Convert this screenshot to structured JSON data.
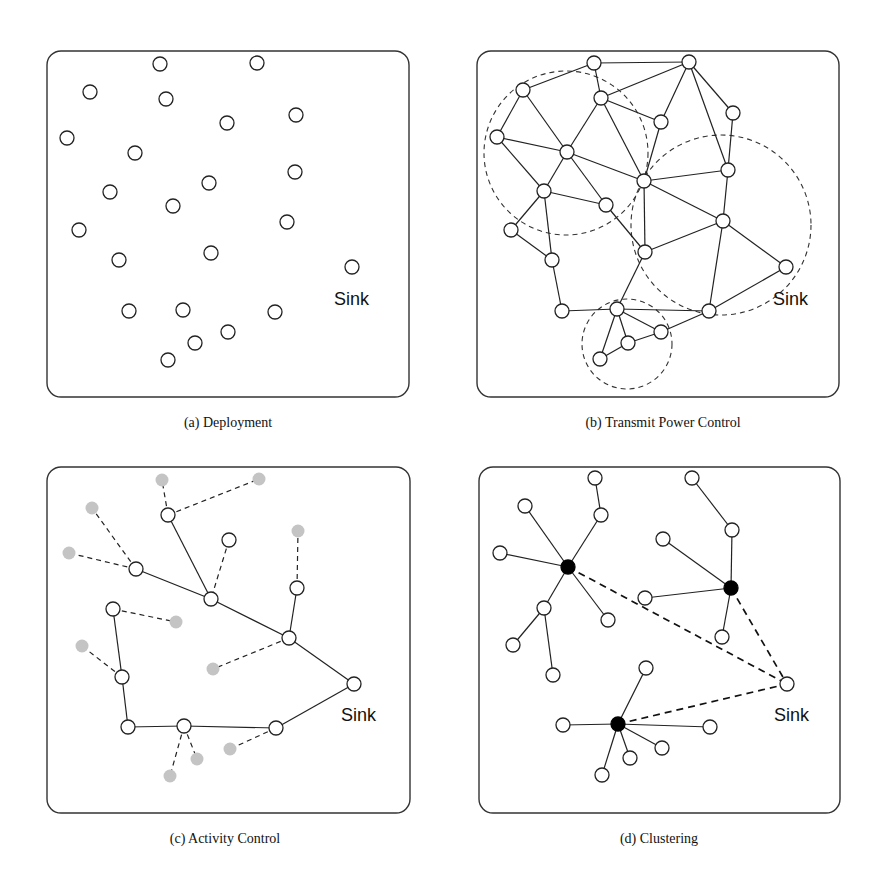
{
  "figure": {
    "panels": [
      {
        "id": "a",
        "caption": "(a)  Deployment",
        "box": {
          "x": 47,
          "y": 51,
          "w": 362,
          "h": 346
        },
        "caption_pos": {
          "x": 228,
          "y": 427
        },
        "sink_label": "Sink",
        "sink_label_pos": {
          "x": 334,
          "y": 305
        },
        "range_circles": [],
        "nodes": [
          {
            "x": 160,
            "y": 64,
            "type": "normal"
          },
          {
            "x": 257,
            "y": 63,
            "type": "normal"
          },
          {
            "x": 90,
            "y": 92,
            "type": "normal"
          },
          {
            "x": 166,
            "y": 99,
            "type": "normal"
          },
          {
            "x": 227,
            "y": 123,
            "type": "normal"
          },
          {
            "x": 296,
            "y": 115,
            "type": "normal"
          },
          {
            "x": 67,
            "y": 138,
            "type": "normal"
          },
          {
            "x": 135,
            "y": 153,
            "type": "normal"
          },
          {
            "x": 295,
            "y": 172,
            "type": "normal"
          },
          {
            "x": 110,
            "y": 192,
            "type": "normal"
          },
          {
            "x": 209,
            "y": 183,
            "type": "normal"
          },
          {
            "x": 173,
            "y": 206,
            "type": "normal"
          },
          {
            "x": 287,
            "y": 222,
            "type": "normal"
          },
          {
            "x": 79,
            "y": 230,
            "type": "normal"
          },
          {
            "x": 211,
            "y": 253,
            "type": "normal"
          },
          {
            "x": 119,
            "y": 260,
            "type": "normal"
          },
          {
            "x": 352,
            "y": 267,
            "type": "sink"
          },
          {
            "x": 129,
            "y": 311,
            "type": "normal"
          },
          {
            "x": 183,
            "y": 310,
            "type": "normal"
          },
          {
            "x": 275,
            "y": 312,
            "type": "normal"
          },
          {
            "x": 228,
            "y": 332,
            "type": "normal"
          },
          {
            "x": 195,
            "y": 343,
            "type": "normal"
          },
          {
            "x": 168,
            "y": 360,
            "type": "normal"
          }
        ],
        "edges": []
      },
      {
        "id": "b",
        "caption": "(b)  Transmit Power Control",
        "box": {
          "x": 477,
          "y": 51,
          "w": 362,
          "h": 346
        },
        "caption_pos": {
          "x": 663,
          "y": 427
        },
        "sink_label": "Sink",
        "sink_label_pos": {
          "x": 773,
          "y": 305
        },
        "range_circles": [
          {
            "cx": 566,
            "cy": 153,
            "r": 82
          },
          {
            "cx": 721,
            "cy": 225,
            "r": 90
          },
          {
            "cx": 627,
            "cy": 344,
            "r": 45
          }
        ],
        "nodes": [
          {
            "x": 594,
            "y": 63,
            "type": "normal"
          },
          {
            "x": 689,
            "y": 62,
            "type": "normal"
          },
          {
            "x": 523,
            "y": 90,
            "type": "normal"
          },
          {
            "x": 601,
            "y": 98,
            "type": "normal"
          },
          {
            "x": 661,
            "y": 122,
            "type": "normal"
          },
          {
            "x": 733,
            "y": 113,
            "type": "normal"
          },
          {
            "x": 497,
            "y": 137,
            "type": "normal"
          },
          {
            "x": 567,
            "y": 152,
            "type": "normal"
          },
          {
            "x": 644,
            "y": 181,
            "type": "normal"
          },
          {
            "x": 728,
            "y": 170,
            "type": "normal"
          },
          {
            "x": 544,
            "y": 191,
            "type": "normal"
          },
          {
            "x": 606,
            "y": 205,
            "type": "normal"
          },
          {
            "x": 723,
            "y": 221,
            "type": "normal"
          },
          {
            "x": 511,
            "y": 230,
            "type": "normal"
          },
          {
            "x": 645,
            "y": 252,
            "type": "normal"
          },
          {
            "x": 552,
            "y": 260,
            "type": "normal"
          },
          {
            "x": 786,
            "y": 267,
            "type": "sink"
          },
          {
            "x": 562,
            "y": 311,
            "type": "normal"
          },
          {
            "x": 617,
            "y": 309,
            "type": "normal"
          },
          {
            "x": 709,
            "y": 311,
            "type": "normal"
          },
          {
            "x": 661,
            "y": 332,
            "type": "normal"
          },
          {
            "x": 628,
            "y": 343,
            "type": "normal"
          },
          {
            "x": 600,
            "y": 359,
            "type": "normal"
          }
        ],
        "edges": [
          {
            "a": 0,
            "b": 1,
            "style": "solid"
          },
          {
            "a": 0,
            "b": 2,
            "style": "solid"
          },
          {
            "a": 0,
            "b": 3,
            "style": "solid"
          },
          {
            "a": 1,
            "b": 3,
            "style": "solid"
          },
          {
            "a": 1,
            "b": 4,
            "style": "solid"
          },
          {
            "a": 1,
            "b": 5,
            "style": "solid"
          },
          {
            "a": 1,
            "b": 9,
            "style": "solid"
          },
          {
            "a": 5,
            "b": 9,
            "style": "solid"
          },
          {
            "a": 3,
            "b": 4,
            "style": "solid"
          },
          {
            "a": 3,
            "b": 7,
            "style": "solid"
          },
          {
            "a": 3,
            "b": 8,
            "style": "solid"
          },
          {
            "a": 4,
            "b": 8,
            "style": "solid"
          },
          {
            "a": 2,
            "b": 6,
            "style": "solid"
          },
          {
            "a": 2,
            "b": 7,
            "style": "solid"
          },
          {
            "a": 6,
            "b": 7,
            "style": "solid"
          },
          {
            "a": 6,
            "b": 10,
            "style": "solid"
          },
          {
            "a": 7,
            "b": 10,
            "style": "solid"
          },
          {
            "a": 7,
            "b": 8,
            "style": "solid"
          },
          {
            "a": 7,
            "b": 11,
            "style": "solid"
          },
          {
            "a": 10,
            "b": 11,
            "style": "solid"
          },
          {
            "a": 10,
            "b": 13,
            "style": "solid"
          },
          {
            "a": 10,
            "b": 15,
            "style": "solid"
          },
          {
            "a": 13,
            "b": 15,
            "style": "solid"
          },
          {
            "a": 8,
            "b": 9,
            "style": "solid"
          },
          {
            "a": 8,
            "b": 12,
            "style": "solid"
          },
          {
            "a": 8,
            "b": 14,
            "style": "solid"
          },
          {
            "a": 9,
            "b": 12,
            "style": "solid"
          },
          {
            "a": 11,
            "b": 14,
            "style": "solid"
          },
          {
            "a": 12,
            "b": 14,
            "style": "solid"
          },
          {
            "a": 12,
            "b": 16,
            "style": "solid"
          },
          {
            "a": 12,
            "b": 19,
            "style": "solid"
          },
          {
            "a": 16,
            "b": 19,
            "style": "solid"
          },
          {
            "a": 14,
            "b": 18,
            "style": "solid"
          },
          {
            "a": 15,
            "b": 17,
            "style": "solid"
          },
          {
            "a": 17,
            "b": 18,
            "style": "solid"
          },
          {
            "a": 18,
            "b": 19,
            "style": "solid"
          },
          {
            "a": 18,
            "b": 20,
            "style": "solid"
          },
          {
            "a": 18,
            "b": 21,
            "style": "solid"
          },
          {
            "a": 18,
            "b": 22,
            "style": "solid"
          },
          {
            "a": 19,
            "b": 20,
            "style": "solid"
          },
          {
            "a": 20,
            "b": 21,
            "style": "solid"
          },
          {
            "a": 21,
            "b": 22,
            "style": "solid"
          }
        ]
      },
      {
        "id": "c",
        "caption": "(c)  Activity Control",
        "box": {
          "x": 47,
          "y": 467,
          "w": 363,
          "h": 346
        },
        "caption_pos": {
          "x": 225,
          "y": 843
        },
        "sink_label": "Sink",
        "sink_label_pos": {
          "x": 341,
          "y": 721
        },
        "range_circles": [],
        "nodes": [
          {
            "x": 168,
            "y": 515,
            "type": "normal"
          },
          {
            "x": 229,
            "y": 540,
            "type": "normal"
          },
          {
            "x": 136,
            "y": 569,
            "type": "normal"
          },
          {
            "x": 211,
            "y": 599,
            "type": "normal"
          },
          {
            "x": 297,
            "y": 588,
            "type": "normal"
          },
          {
            "x": 113,
            "y": 609,
            "type": "normal"
          },
          {
            "x": 289,
            "y": 638,
            "type": "normal"
          },
          {
            "x": 122,
            "y": 677,
            "type": "normal"
          },
          {
            "x": 354,
            "y": 684,
            "type": "sink"
          },
          {
            "x": 128,
            "y": 727,
            "type": "normal"
          },
          {
            "x": 184,
            "y": 726,
            "type": "normal"
          },
          {
            "x": 276,
            "y": 728,
            "type": "normal"
          },
          {
            "x": 162,
            "y": 480,
            "type": "sleep"
          },
          {
            "x": 259,
            "y": 479,
            "type": "sleep"
          },
          {
            "x": 92,
            "y": 508,
            "type": "sleep"
          },
          {
            "x": 298,
            "y": 531,
            "type": "sleep"
          },
          {
            "x": 69,
            "y": 553,
            "type": "sleep"
          },
          {
            "x": 176,
            "y": 622,
            "type": "sleep"
          },
          {
            "x": 82,
            "y": 646,
            "type": "sleep"
          },
          {
            "x": 213,
            "y": 669,
            "type": "sleep"
          },
          {
            "x": 230,
            "y": 749,
            "type": "sleep"
          },
          {
            "x": 197,
            "y": 759,
            "type": "sleep"
          },
          {
            "x": 170,
            "y": 776,
            "type": "sleep"
          }
        ],
        "edges": [
          {
            "a": 0,
            "b": 3,
            "style": "solid"
          },
          {
            "a": 2,
            "b": 3,
            "style": "solid"
          },
          {
            "a": 3,
            "b": 6,
            "style": "solid"
          },
          {
            "a": 4,
            "b": 6,
            "style": "solid"
          },
          {
            "a": 6,
            "b": 8,
            "style": "solid"
          },
          {
            "a": 5,
            "b": 7,
            "style": "solid"
          },
          {
            "a": 7,
            "b": 9,
            "style": "solid"
          },
          {
            "a": 9,
            "b": 10,
            "style": "solid"
          },
          {
            "a": 10,
            "b": 11,
            "style": "solid"
          },
          {
            "a": 11,
            "b": 8,
            "style": "solid"
          },
          {
            "a": 0,
            "b": 12,
            "style": "dashed"
          },
          {
            "a": 0,
            "b": 13,
            "style": "dashed"
          },
          {
            "a": 2,
            "b": 14,
            "style": "dashed"
          },
          {
            "a": 2,
            "b": 16,
            "style": "dashed"
          },
          {
            "a": 1,
            "b": 3,
            "style": "dashed"
          },
          {
            "a": 4,
            "b": 15,
            "style": "dashed"
          },
          {
            "a": 5,
            "b": 17,
            "style": "dashed"
          },
          {
            "a": 7,
            "b": 18,
            "style": "dashed"
          },
          {
            "a": 6,
            "b": 19,
            "style": "dashed"
          },
          {
            "a": 11,
            "b": 20,
            "style": "dashed"
          },
          {
            "a": 10,
            "b": 21,
            "style": "dashed"
          },
          {
            "a": 10,
            "b": 22,
            "style": "dashed"
          }
        ]
      },
      {
        "id": "d",
        "caption": "(d)  Clustering",
        "box": {
          "x": 479,
          "y": 467,
          "w": 361,
          "h": 346
        },
        "caption_pos": {
          "x": 659,
          "y": 843
        },
        "sink_label": "Sink",
        "sink_label_pos": {
          "x": 774,
          "y": 721
        },
        "range_circles": [],
        "nodes": [
          {
            "x": 568,
            "y": 567,
            "type": "head"
          },
          {
            "x": 731,
            "y": 588,
            "type": "head"
          },
          {
            "x": 618,
            "y": 724,
            "type": "head"
          },
          {
            "x": 595,
            "y": 478,
            "type": "normal"
          },
          {
            "x": 601,
            "y": 515,
            "type": "normal"
          },
          {
            "x": 525,
            "y": 506,
            "type": "normal"
          },
          {
            "x": 500,
            "y": 553,
            "type": "normal"
          },
          {
            "x": 544,
            "y": 608,
            "type": "normal"
          },
          {
            "x": 608,
            "y": 620,
            "type": "normal"
          },
          {
            "x": 513,
            "y": 645,
            "type": "normal"
          },
          {
            "x": 553,
            "y": 675,
            "type": "normal"
          },
          {
            "x": 692,
            "y": 478,
            "type": "normal"
          },
          {
            "x": 732,
            "y": 530,
            "type": "normal"
          },
          {
            "x": 663,
            "y": 539,
            "type": "normal"
          },
          {
            "x": 645,
            "y": 598,
            "type": "normal"
          },
          {
            "x": 722,
            "y": 637,
            "type": "normal"
          },
          {
            "x": 787,
            "y": 684,
            "type": "sink"
          },
          {
            "x": 646,
            "y": 668,
            "type": "normal"
          },
          {
            "x": 563,
            "y": 725,
            "type": "normal"
          },
          {
            "x": 710,
            "y": 727,
            "type": "normal"
          },
          {
            "x": 662,
            "y": 748,
            "type": "normal"
          },
          {
            "x": 630,
            "y": 758,
            "type": "normal"
          },
          {
            "x": 602,
            "y": 775,
            "type": "normal"
          }
        ],
        "edges": [
          {
            "a": 3,
            "b": 4,
            "style": "solid"
          },
          {
            "a": 4,
            "b": 0,
            "style": "solid"
          },
          {
            "a": 5,
            "b": 0,
            "style": "solid"
          },
          {
            "a": 6,
            "b": 0,
            "style": "solid"
          },
          {
            "a": 0,
            "b": 7,
            "style": "solid"
          },
          {
            "a": 0,
            "b": 8,
            "style": "solid"
          },
          {
            "a": 7,
            "b": 9,
            "style": "solid"
          },
          {
            "a": 7,
            "b": 10,
            "style": "solid"
          },
          {
            "a": 11,
            "b": 12,
            "style": "solid"
          },
          {
            "a": 12,
            "b": 1,
            "style": "solid"
          },
          {
            "a": 13,
            "b": 1,
            "style": "solid"
          },
          {
            "a": 14,
            "b": 1,
            "style": "solid"
          },
          {
            "a": 1,
            "b": 15,
            "style": "solid"
          },
          {
            "a": 2,
            "b": 17,
            "style": "solid"
          },
          {
            "a": 2,
            "b": 18,
            "style": "solid"
          },
          {
            "a": 2,
            "b": 19,
            "style": "solid"
          },
          {
            "a": 2,
            "b": 20,
            "style": "solid"
          },
          {
            "a": 2,
            "b": 21,
            "style": "solid"
          },
          {
            "a": 2,
            "b": 22,
            "style": "solid"
          },
          {
            "a": 0,
            "b": 16,
            "style": "bold-dashed"
          },
          {
            "a": 1,
            "b": 16,
            "style": "bold-dashed"
          },
          {
            "a": 2,
            "b": 16,
            "style": "bold-dashed"
          }
        ]
      }
    ],
    "node_radius": 7,
    "colors": {
      "stroke": "#222222",
      "sleep_node": "#c4c4c4",
      "cluster_head": "#000000",
      "background": "#ffffff"
    }
  }
}
